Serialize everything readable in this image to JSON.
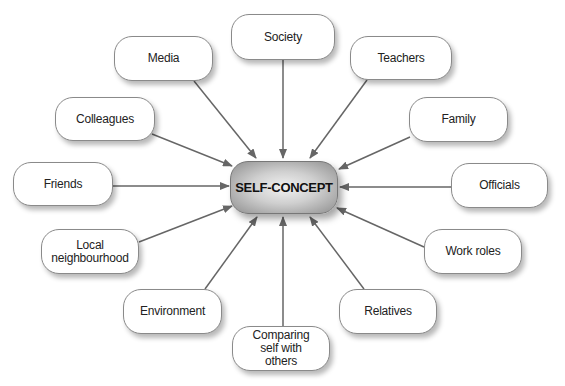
{
  "diagram": {
    "center": {
      "label": "SELF-CONCEPT"
    },
    "nodes": [
      {
        "id": "media",
        "label": "Media"
      },
      {
        "id": "society",
        "label": "Society"
      },
      {
        "id": "teachers",
        "label": "Teachers"
      },
      {
        "id": "family",
        "label": "Family"
      },
      {
        "id": "colleagues",
        "label": "Colleagues"
      },
      {
        "id": "friends",
        "label": "Friends"
      },
      {
        "id": "officials",
        "label": "Officials"
      },
      {
        "id": "local",
        "label": "Local\nneighbourhood"
      },
      {
        "id": "work_roles",
        "label": "Work roles"
      },
      {
        "id": "environment",
        "label": "Environment"
      },
      {
        "id": "comparing",
        "label": "Comparing\nself with\nothers"
      },
      {
        "id": "relatives",
        "label": "Relatives"
      }
    ],
    "edges": [
      {
        "from": "media",
        "to": "center"
      },
      {
        "from": "society",
        "to": "center"
      },
      {
        "from": "teachers",
        "to": "center"
      },
      {
        "from": "family",
        "to": "center"
      },
      {
        "from": "colleagues",
        "to": "center"
      },
      {
        "from": "friends",
        "to": "center"
      },
      {
        "from": "officials",
        "to": "center"
      },
      {
        "from": "local",
        "to": "center"
      },
      {
        "from": "work_roles",
        "to": "center"
      },
      {
        "from": "environment",
        "to": "center"
      },
      {
        "from": "comparing",
        "to": "center"
      },
      {
        "from": "relatives",
        "to": "center"
      }
    ],
    "colors": {
      "arrow": "#666666",
      "node_border": "#8a8a8a",
      "center_fill": "#bdbdbd"
    }
  }
}
